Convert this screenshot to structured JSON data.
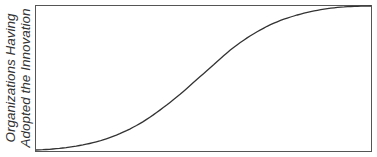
{
  "chart_data": {
    "type": "line",
    "title": "",
    "xlabel": "",
    "ylabel": "Organizations Having Adopted the Innovation",
    "ylabel_lines": [
      "Organizations Having",
      "Adopted the Innovation"
    ],
    "grid": false,
    "legend": null,
    "x": [
      0,
      0.1,
      0.2,
      0.3,
      0.4,
      0.5,
      0.6,
      0.7,
      0.8,
      0.9,
      1.0
    ],
    "series": [
      {
        "name": "S-curve adoption",
        "values": [
          0.0,
          0.02,
          0.07,
          0.17,
          0.33,
          0.53,
          0.73,
          0.87,
          0.95,
          0.99,
          1.0
        ]
      }
    ],
    "xlim": [
      0,
      1
    ],
    "ylim": [
      0,
      1
    ],
    "colors": {
      "line": "#333333",
      "frame": "#555555"
    }
  }
}
